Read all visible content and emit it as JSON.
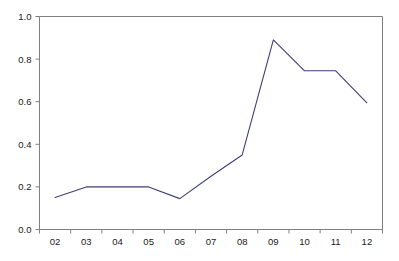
{
  "chart_data": {
    "type": "line",
    "title": "",
    "xlabel": "",
    "ylabel": "",
    "categories": [
      "02",
      "03",
      "04",
      "05",
      "06",
      "07",
      "08",
      "09",
      "10",
      "11",
      "12"
    ],
    "values": [
      0.15,
      0.2,
      0.2,
      0.2,
      0.145,
      0.25,
      0.35,
      0.89,
      0.745,
      0.745,
      0.595
    ],
    "series": [
      {
        "name": "series-1",
        "values": [
          0.15,
          0.2,
          0.2,
          0.2,
          0.145,
          0.25,
          0.35,
          0.89,
          0.745,
          0.745,
          0.595
        ]
      }
    ],
    "ylim": [
      0.0,
      1.0
    ],
    "ytick_labels": [
      "0.0",
      "0.2",
      "0.4",
      "0.6",
      "0.8",
      "1.0"
    ],
    "ytick_values": [
      0.0,
      0.2,
      0.4,
      0.6,
      0.8,
      1.0
    ],
    "xtick_labels": [
      "02",
      "03",
      "04",
      "05",
      "06",
      "07",
      "08",
      "09",
      "10",
      "11",
      "12"
    ],
    "grid": false,
    "legend": false,
    "legend_position": "none",
    "colors": {
      "line": "#3f3f7a",
      "axis": "#808080",
      "tick_text": "#1a1a1a",
      "background": "#ffffff"
    }
  }
}
